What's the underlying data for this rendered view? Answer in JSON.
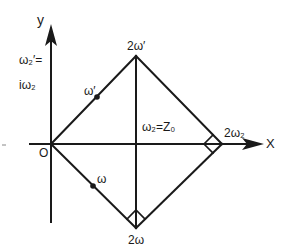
{
  "figure": {
    "type": "period-parallelogram-diagram",
    "stroke_color": "#1a1a1a",
    "background": "#ffffff",
    "axes": {
      "x_label": "X",
      "y_label": "y",
      "origin_label": "O"
    },
    "left_annotation": {
      "line1": "ω₂′=",
      "line2": "iω₂"
    },
    "vertices": {
      "top": "2ω′",
      "right": "2ω₂",
      "bottom": "2ω"
    },
    "points": {
      "upper_midpoint": "ω′",
      "lower_midpoint": "ω"
    },
    "center_annotation": "ω₂=Z₀",
    "right_angle_markers": [
      "right vertex",
      "bottom vertex"
    ]
  }
}
